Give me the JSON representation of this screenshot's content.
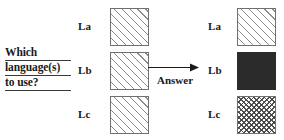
{
  "diagram": {
    "question": {
      "lines": [
        "Which",
        "language(s)",
        "to use?"
      ]
    },
    "arrow": {
      "label": "Answer",
      "icon": "arrow-right-icon"
    },
    "input_column": {
      "rows": [
        {
          "label": "La",
          "pattern": "diagonal-hatch"
        },
        {
          "label": "Lb",
          "pattern": "diagonal-hatch"
        },
        {
          "label": "Lc",
          "pattern": "diagonal-hatch"
        }
      ]
    },
    "output_column": {
      "rows": [
        {
          "label": "La",
          "pattern": "diagonal-hatch"
        },
        {
          "label": "Lb",
          "pattern": "solid-fill"
        },
        {
          "label": "Lc",
          "pattern": "checkerboard"
        }
      ]
    },
    "colors": {
      "background": "#ffffff",
      "text": "#1a1a1a",
      "box_border": "#707070",
      "hatch_line": "#8d8d8d",
      "solid_fill": "#2b2b2b",
      "check_line": "#3c3c3c",
      "rule": "#3a3a3a"
    }
  }
}
